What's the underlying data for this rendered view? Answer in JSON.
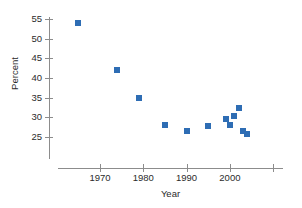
{
  "chart_data": {
    "type": "scatter",
    "title": "",
    "xlabel": "Year",
    "ylabel": "Percent",
    "xlim": [
      1962,
      2010
    ],
    "ylim": [
      22,
      56
    ],
    "grid": false,
    "legend": null,
    "marker_color": "#2E6DB4",
    "axis_color": "#8c8c8c",
    "x_ticks": [
      {
        "value": 1970,
        "label": "1970"
      },
      {
        "value": 1980,
        "label": "1980"
      },
      {
        "value": 1990,
        "label": "1990"
      },
      {
        "value": 2000,
        "label": "2000"
      },
      {
        "value": 2010,
        "label": ""
      }
    ],
    "y_ticks": [
      {
        "value": 25,
        "label": "25"
      },
      {
        "value": 30,
        "label": "30"
      },
      {
        "value": 35,
        "label": "35"
      },
      {
        "value": 40,
        "label": "40"
      },
      {
        "value": 45,
        "label": "45"
      },
      {
        "value": 50,
        "label": "50"
      },
      {
        "value": 55,
        "label": "55"
      }
    ],
    "points": [
      {
        "x": 1965,
        "y": 54.0
      },
      {
        "x": 1974,
        "y": 42.1
      },
      {
        "x": 1979,
        "y": 35.0
      },
      {
        "x": 1985,
        "y": 28.1
      },
      {
        "x": 1990,
        "y": 26.6
      },
      {
        "x": 1995,
        "y": 27.9
      },
      {
        "x": 1999,
        "y": 29.6
      },
      {
        "x": 2000,
        "y": 28.1
      },
      {
        "x": 2001,
        "y": 30.3
      },
      {
        "x": 2002,
        "y": 32.3
      },
      {
        "x": 2003,
        "y": 26.4
      },
      {
        "x": 2004,
        "y": 25.8
      }
    ]
  }
}
